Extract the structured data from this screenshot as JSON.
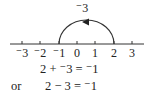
{
  "diagram": {
    "arc_label": "⁻3",
    "arc": {
      "from": 2,
      "to": -1,
      "direction": "leftward"
    },
    "number_line": {
      "ticks": [
        -3,
        -2,
        -1,
        0,
        1,
        2,
        3
      ],
      "tick_labels": [
        "⁻3",
        "⁻2",
        "⁻1",
        "0",
        "1",
        "2",
        "3"
      ]
    }
  },
  "equations": {
    "line1": "2 + ⁻3 = ⁻1",
    "or_label": "or",
    "line2": "2 − 3 = ⁻1"
  }
}
